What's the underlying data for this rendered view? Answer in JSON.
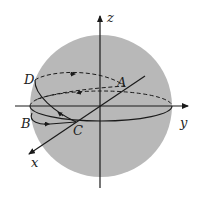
{
  "diagram": {
    "type": "sphere-with-axes",
    "colors": {
      "sphere_fill": "#b8b8b8",
      "stroke": "#1a1a1a",
      "background": "#ffffff"
    },
    "axes": {
      "x": "x",
      "y": "y",
      "z": "z"
    },
    "points": {
      "A": "A",
      "B": "B",
      "C": "C",
      "D": "D"
    }
  }
}
